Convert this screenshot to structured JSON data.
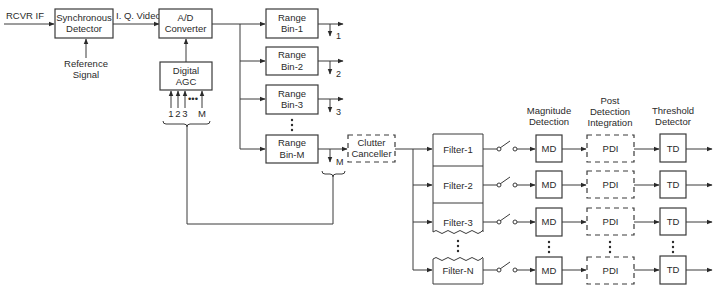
{
  "diagram": {
    "type": "block-diagram"
  },
  "input": {
    "label": "RCVR IF"
  },
  "sync_detector": {
    "line1": "Synchronous",
    "line2": "Detector"
  },
  "reference": {
    "line1": "Reference",
    "line2": "Signal"
  },
  "iq_video": {
    "label": "I. Q. Video"
  },
  "adc": {
    "line1": "A/D",
    "line2": "Converter"
  },
  "agc": {
    "line1": "Digital",
    "line2": "AGC",
    "inputs": [
      "1",
      "2",
      "3",
      "M"
    ],
    "ellipsis": "•••"
  },
  "range_bins": [
    {
      "line1": "Range",
      "line2": "Bin-1",
      "tap": "1"
    },
    {
      "line1": "Range",
      "line2": "Bin-2",
      "tap": "2"
    },
    {
      "line1": "Range",
      "line2": "Bin-3",
      "tap": "3"
    },
    {
      "line1": "Range",
      "line2": "Bin-M",
      "tap": "M"
    }
  ],
  "clutter_canceller": {
    "line1": "Clutter",
    "line2": "Canceller"
  },
  "filters": [
    "Filter-1",
    "Filter-2",
    "Filter-3",
    "Filter-N"
  ],
  "column_headers": {
    "md": {
      "line1": "Magnitude",
      "line2": "Detection"
    },
    "pdi": {
      "line1": "Post",
      "line2": "Detection",
      "line3": "Integration"
    },
    "td": {
      "line1": "Threshold",
      "line2": "Detector"
    }
  },
  "stage_labels": {
    "md": "MD",
    "pdi": "PDI",
    "td": "TD"
  },
  "colors": {
    "line": "#3a3a3a",
    "text": "#2a2a2a",
    "background": "#ffffff"
  }
}
